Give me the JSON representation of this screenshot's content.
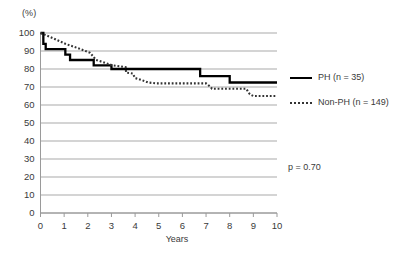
{
  "chart_data": {
    "type": "line",
    "title": "",
    "subtitle": "",
    "xlabel": "Years",
    "ylabel": "(%)",
    "xlim": [
      0,
      10
    ],
    "ylim": [
      0,
      100
    ],
    "xticks": [
      "0",
      "1",
      "2",
      "3",
      "4",
      "5",
      "6",
      "7",
      "8",
      "9",
      "10"
    ],
    "yticks": [
      "0",
      "10",
      "20",
      "30",
      "40",
      "50",
      "60",
      "70",
      "80",
      "90",
      "100"
    ],
    "grid": "horizontal",
    "legend_position": "right",
    "annotations": [
      {
        "name": "p-value",
        "text": "p = 0.70"
      }
    ],
    "series": [
      {
        "name": "PH (n = 35)",
        "label": "PH (n = 35)",
        "style": "solid",
        "color": "#000000",
        "points": [
          [
            0.0,
            100.0
          ],
          [
            0.12,
            100.0
          ],
          [
            0.12,
            94.0
          ],
          [
            0.22,
            94.0
          ],
          [
            0.22,
            91.0
          ],
          [
            1.05,
            91.0
          ],
          [
            1.05,
            88.0
          ],
          [
            1.25,
            88.0
          ],
          [
            1.25,
            85.0
          ],
          [
            2.25,
            85.0
          ],
          [
            2.25,
            82.0
          ],
          [
            3.0,
            82.0
          ],
          [
            3.0,
            80.0
          ],
          [
            6.75,
            80.0
          ],
          [
            6.75,
            76.0
          ],
          [
            8.0,
            76.0
          ],
          [
            8.0,
            72.5
          ],
          [
            10.0,
            72.5
          ]
        ]
      },
      {
        "name": "Non-PH (n = 149)",
        "label": "Non-PH (n = 149)",
        "style": "dotted",
        "color": "#333333",
        "points": [
          [
            0.0,
            100.0
          ],
          [
            0.55,
            97.0
          ],
          [
            1.05,
            94.0
          ],
          [
            1.6,
            91.5
          ],
          [
            2.1,
            89.0
          ],
          [
            2.35,
            85.0
          ],
          [
            2.6,
            84.0
          ],
          [
            3.05,
            82.0
          ],
          [
            3.35,
            81.5
          ],
          [
            3.6,
            81.0
          ],
          [
            3.62,
            78.0
          ],
          [
            3.9,
            77.5
          ],
          [
            4.0,
            75.0
          ],
          [
            4.25,
            74.0
          ],
          [
            4.55,
            72.5
          ],
          [
            4.9,
            72.0
          ],
          [
            7.0,
            72.0
          ],
          [
            7.2,
            70.0
          ],
          [
            7.25,
            69.0
          ],
          [
            8.7,
            69.0
          ],
          [
            8.85,
            66.0
          ],
          [
            9.0,
            65.0
          ],
          [
            10.0,
            65.0
          ]
        ]
      }
    ]
  },
  "axes": {
    "y_unit_label": "(%)",
    "x_axis_title": "Years"
  },
  "legend": {
    "items": [
      {
        "label": "PH (n = 35)",
        "style": "solid"
      },
      {
        "label": "Non-PH (n = 149)",
        "style": "dotted"
      }
    ]
  },
  "stats": {
    "p_value_text": "p = 0.70"
  }
}
